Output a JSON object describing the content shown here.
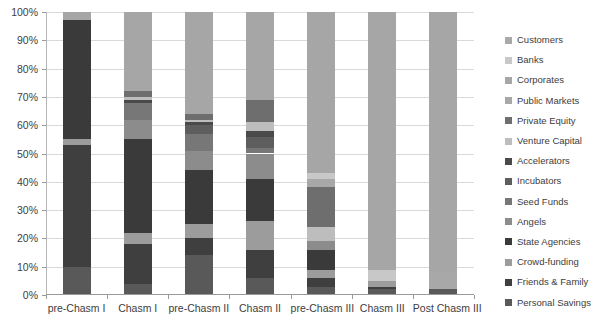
{
  "chart_data": {
    "type": "bar",
    "subtype": "stacked-100-percent",
    "title": "",
    "xlabel": "",
    "ylabel": "",
    "ylim": [
      0,
      100
    ],
    "y_tick_labels": [
      "0%",
      "10%",
      "20%",
      "30%",
      "40%",
      "50%",
      "60%",
      "70%",
      "80%",
      "90%",
      "100%"
    ],
    "y_tick_values": [
      0,
      10,
      20,
      30,
      40,
      50,
      60,
      70,
      80,
      90,
      100
    ],
    "grid": true,
    "legend_position": "right",
    "categories": [
      "pre-Chasm I",
      "Chasm I",
      "pre-Chasm II",
      "Chasm II",
      "pre-Chasm III",
      "Chasm III",
      "Post Chasm III"
    ],
    "series": [
      {
        "name": "Personal Savings",
        "color": "#595959",
        "values": [
          10,
          4,
          14,
          6,
          3,
          2,
          0
        ]
      },
      {
        "name": "Friends & Family",
        "color": "#3f3f3f",
        "values": [
          43,
          14,
          6,
          10,
          3,
          1,
          0
        ]
      },
      {
        "name": "Crowd-funding",
        "color": "#9c9c9c",
        "values": [
          2,
          4,
          5,
          10,
          3,
          2,
          0
        ]
      },
      {
        "name": "State Agencies",
        "color": "#3a3a3a",
        "values": [
          42,
          33,
          19,
          15,
          7,
          0,
          0
        ]
      },
      {
        "name": "Angels",
        "color": "#8c8c8c",
        "values": [
          0,
          7,
          7,
          9,
          3,
          0,
          0
        ]
      },
      {
        "name": "Seed Funds",
        "color": "#777777",
        "values": [
          0,
          6,
          6,
          2,
          0,
          0,
          0
        ]
      },
      {
        "name": "Incubators",
        "color": "#5e5e5e",
        "values": [
          0,
          0,
          3,
          4,
          0,
          0,
          0
        ]
      },
      {
        "name": "Accelerators",
        "color": "#4a4a4a",
        "values": [
          0,
          1,
          1,
          2,
          0,
          0,
          0
        ]
      },
      {
        "name": "Venture Capital",
        "color": "#bdbdbd",
        "values": [
          0,
          1,
          1,
          3,
          5,
          0,
          0
        ]
      },
      {
        "name": "Private Equity",
        "color": "#6e6e6e",
        "values": [
          0,
          2,
          2,
          8,
          14,
          0,
          0
        ]
      },
      {
        "name": "Public Markets",
        "color": "#a8a8a8",
        "values": [
          0,
          0,
          0,
          0,
          3,
          0,
          6
        ]
      },
      {
        "name": "Banks",
        "color": "#c8c8c8",
        "values": [
          0,
          0,
          0,
          0,
          2,
          4,
          2
        ]
      },
      {
        "name": "Corporates",
        "color": "#a6a6a6",
        "values": [
          3,
          28,
          36,
          31,
          57,
          91,
          92
        ]
      }
    ],
    "legend_entries": [
      {
        "label": "Customers",
        "color": "#a9a9a9"
      },
      {
        "label": "Banks",
        "color": "#c8c8c8"
      },
      {
        "label": "Corporates",
        "color": "#a6a6a6"
      },
      {
        "label": "Public Markets",
        "color": "#a8a8a8"
      },
      {
        "label": "Private Equity",
        "color": "#6e6e6e"
      },
      {
        "label": "Venture Capital",
        "color": "#bdbdbd"
      },
      {
        "label": "Accelerators",
        "color": "#4a4a4a"
      },
      {
        "label": "Incubators",
        "color": "#5e5e5e"
      },
      {
        "label": "Seed Funds",
        "color": "#777777"
      },
      {
        "label": "Angels",
        "color": "#8c8c8c"
      },
      {
        "label": "State Agencies",
        "color": "#3a3a3a"
      },
      {
        "label": "Crowd-funding",
        "color": "#9c9c9c"
      },
      {
        "label": "Friends & Family",
        "color": "#3f3f3f"
      },
      {
        "label": "Personal Savings",
        "color": "#595959"
      }
    ],
    "stacks": [
      {
        "category": "pre-Chasm I",
        "segments": [
          {
            "label": "Personal Savings",
            "start": 0,
            "end": 10,
            "color": "#595959"
          },
          {
            "label": "Friends & Family",
            "start": 10,
            "end": 53,
            "color": "#3f3f3f"
          },
          {
            "label": "Crowd-funding",
            "start": 53,
            "end": 55,
            "color": "#9c9c9c"
          },
          {
            "label": "State Agencies",
            "start": 55,
            "end": 97,
            "color": "#3a3a3a"
          },
          {
            "label": "Corporates",
            "start": 97,
            "end": 100,
            "color": "#a6a6a6"
          }
        ]
      },
      {
        "category": "Chasm I",
        "segments": [
          {
            "label": "Personal Savings",
            "start": 0,
            "end": 4,
            "color": "#595959"
          },
          {
            "label": "Friends & Family",
            "start": 4,
            "end": 18,
            "color": "#3f3f3f"
          },
          {
            "label": "Crowd-funding",
            "start": 18,
            "end": 22,
            "color": "#9c9c9c"
          },
          {
            "label": "State Agencies",
            "start": 22,
            "end": 55,
            "color": "#3a3a3a"
          },
          {
            "label": "Angels",
            "start": 55,
            "end": 62,
            "color": "#8c8c8c"
          },
          {
            "label": "Seed Funds",
            "start": 62,
            "end": 68,
            "color": "#777777"
          },
          {
            "label": "Accelerators",
            "start": 68,
            "end": 69,
            "color": "#4a4a4a"
          },
          {
            "label": "Venture Capital",
            "start": 69,
            "end": 70,
            "color": "#bdbdbd"
          },
          {
            "label": "Private Equity",
            "start": 70,
            "end": 72,
            "color": "#6e6e6e"
          },
          {
            "label": "Corporates",
            "start": 72,
            "end": 100,
            "color": "#a6a6a6"
          }
        ]
      },
      {
        "category": "pre-Chasm II",
        "segments": [
          {
            "label": "Personal Savings",
            "start": 0,
            "end": 14,
            "color": "#595959"
          },
          {
            "label": "Friends & Family",
            "start": 14,
            "end": 20,
            "color": "#3f3f3f"
          },
          {
            "label": "Crowd-funding",
            "start": 20,
            "end": 25,
            "color": "#9c9c9c"
          },
          {
            "label": "State Agencies",
            "start": 25,
            "end": 44,
            "color": "#3a3a3a"
          },
          {
            "label": "Angels",
            "start": 44,
            "end": 51,
            "color": "#8c8c8c"
          },
          {
            "label": "Seed Funds",
            "start": 51,
            "end": 57,
            "color": "#777777"
          },
          {
            "label": "Incubators",
            "start": 57,
            "end": 60,
            "color": "#5e5e5e"
          },
          {
            "label": "Accelerators",
            "start": 60,
            "end": 61,
            "color": "#4a4a4a"
          },
          {
            "label": "Venture Capital",
            "start": 61,
            "end": 62,
            "color": "#bdbdbd"
          },
          {
            "label": "Private Equity",
            "start": 62,
            "end": 64,
            "color": "#6e6e6e"
          },
          {
            "label": "Corporates",
            "start": 64,
            "end": 100,
            "color": "#a6a6a6"
          }
        ]
      },
      {
        "category": "Chasm II",
        "segments": [
          {
            "label": "Personal Savings",
            "start": 0,
            "end": 6,
            "color": "#595959"
          },
          {
            "label": "Friends & Family",
            "start": 6,
            "end": 16,
            "color": "#3f3f3f"
          },
          {
            "label": "Crowd-funding",
            "start": 16,
            "end": 26,
            "color": "#9c9c9c"
          },
          {
            "label": "State Agencies",
            "start": 26,
            "end": 41,
            "color": "#3a3a3a"
          },
          {
            "label": "Angels",
            "start": 41,
            "end": 50,
            "color": "#8c8c8c"
          },
          {
            "label": "Seed Funds",
            "start": 50,
            "end": 52,
            "color": "#777777"
          },
          {
            "label": "Incubators",
            "start": 52,
            "end": 56,
            "color": "#5e5e5e"
          },
          {
            "label": "Accelerators",
            "start": 56,
            "end": 58,
            "color": "#4a4a4a"
          },
          {
            "label": "Venture Capital",
            "start": 58,
            "end": 61,
            "color": "#bdbdbd"
          },
          {
            "label": "Private Equity",
            "start": 61,
            "end": 69,
            "color": "#6e6e6e"
          },
          {
            "label": "Corporates",
            "start": 69,
            "end": 100,
            "color": "#a6a6a6"
          }
        ]
      },
      {
        "category": "pre-Chasm III",
        "segments": [
          {
            "label": "Personal Savings",
            "start": 0,
            "end": 3,
            "color": "#595959"
          },
          {
            "label": "Friends & Family",
            "start": 3,
            "end": 6,
            "color": "#3f3f3f"
          },
          {
            "label": "Crowd-funding",
            "start": 6,
            "end": 9,
            "color": "#9c9c9c"
          },
          {
            "label": "State Agencies",
            "start": 9,
            "end": 16,
            "color": "#3a3a3a"
          },
          {
            "label": "Angels",
            "start": 16,
            "end": 19,
            "color": "#8c8c8c"
          },
          {
            "label": "Venture Capital",
            "start": 19,
            "end": 24,
            "color": "#bdbdbd"
          },
          {
            "label": "Private Equity",
            "start": 24,
            "end": 38,
            "color": "#6e6e6e"
          },
          {
            "label": "Public Markets",
            "start": 38,
            "end": 41,
            "color": "#a8a8a8"
          },
          {
            "label": "Banks",
            "start": 41,
            "end": 43,
            "color": "#c8c8c8"
          },
          {
            "label": "Corporates",
            "start": 43,
            "end": 100,
            "color": "#a6a6a6"
          }
        ]
      },
      {
        "category": "Chasm III",
        "segments": [
          {
            "label": "Personal Savings",
            "start": 0,
            "end": 2,
            "color": "#595959"
          },
          {
            "label": "Friends & Family",
            "start": 2,
            "end": 3,
            "color": "#3f3f3f"
          },
          {
            "label": "Crowd-funding",
            "start": 3,
            "end": 5,
            "color": "#9c9c9c"
          },
          {
            "label": "Banks",
            "start": 5,
            "end": 9,
            "color": "#c8c8c8"
          },
          {
            "label": "Corporates",
            "start": 9,
            "end": 100,
            "color": "#a6a6a6"
          }
        ]
      },
      {
        "category": "Post Chasm III",
        "segments": [
          {
            "label": "Personal Savings",
            "start": 0,
            "end": 2,
            "color": "#595959"
          },
          {
            "label": "Public Markets",
            "start": 2,
            "end": 8,
            "color": "#a8a8a8"
          },
          {
            "label": "Corporates",
            "start": 8,
            "end": 100,
            "color": "#a6a6a6"
          }
        ]
      }
    ]
  }
}
